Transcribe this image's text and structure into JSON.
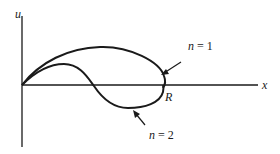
{
  "diagram": {
    "axes": {
      "x_label": "x",
      "y_label": "u",
      "point_label": "R"
    },
    "curves": [
      {
        "name": "n1",
        "label_var": "n",
        "label_eq": " = 1"
      },
      {
        "name": "n2",
        "label_var": "n",
        "label_eq": " = 2"
      }
    ],
    "colors": {
      "stroke": "#1a1a1a",
      "background": "#ffffff"
    }
  }
}
